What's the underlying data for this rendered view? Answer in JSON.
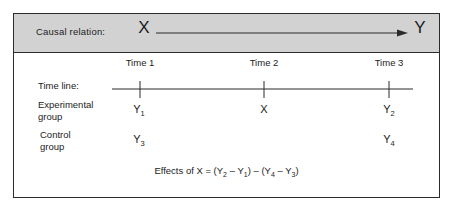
{
  "figure": {
    "causal_band": {
      "label": "Causal relation:",
      "cause": "X",
      "effect": "Y",
      "arrow": "rightwards-arrow",
      "background_color": "#d2d2d2"
    },
    "timeline": {
      "label": "Time line:",
      "ticks": [
        {
          "label": "Time 1"
        },
        {
          "label": "Time 2"
        },
        {
          "label": "Time 3"
        }
      ]
    },
    "rows": [
      {
        "label": "Experimental\ngroup",
        "cells": [
          {
            "base": "Y",
            "sub": "1"
          },
          {
            "base": "X",
            "sub": ""
          },
          {
            "base": "Y",
            "sub": "2"
          }
        ]
      },
      {
        "label": "Control\ngroup",
        "cells": [
          {
            "base": "Y",
            "sub": "3"
          },
          {
            "base": "",
            "sub": ""
          },
          {
            "base": "Y",
            "sub": "4"
          }
        ]
      }
    ],
    "effects": {
      "prefix": "Effects of X = (Y",
      "s1": "2",
      "mid1": " – Y",
      "s2": "1",
      "mid2": ") – (Y",
      "s3": "4",
      "mid3": " – Y",
      "s4": "3",
      "suffix": ")"
    },
    "colors": {
      "border": "#2b2b2b",
      "text": "#1c1c1c",
      "band": "#d2d2d2",
      "page": "#ffffff"
    }
  }
}
